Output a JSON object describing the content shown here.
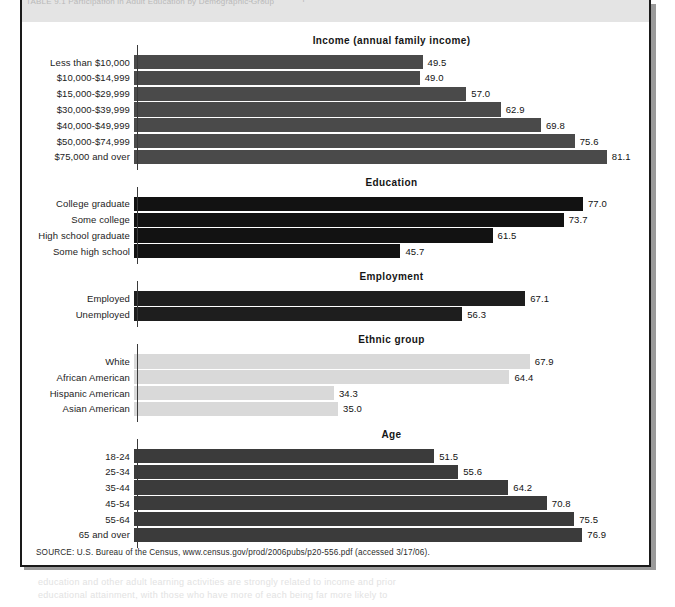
{
  "figure": {
    "header_ghost_text": "TABLE 9.1  Participation in Adult Education by Demographic Group",
    "source": "SOURCE: U.S. Bureau of the Census, www.census.gov/prod/2006pubs/p20-556.pdf (accessed 3/17/06).",
    "bleed_below_line1": "education and other adult learning activities are strongly related to income and prior",
    "bleed_below_line2": "educational attainment, with those who have more of each being far more likely to"
  },
  "chart_data": {
    "type": "bar",
    "orientation": "horizontal",
    "title": "",
    "xlabel": "",
    "ylabel": "",
    "xlim": [
      0,
      100
    ],
    "grid": false,
    "legend": false,
    "axis_max": 100,
    "sections": [
      {
        "name": "Income (annual family income)",
        "color": "#4a4a4a",
        "categories": [
          "Less than $10,000",
          "$10,000-$14,999",
          "$15,000-$29,999",
          "$30,000-$39,999",
          "$40,000-$49,999",
          "$50,000-$74,999",
          "$75,000 and over"
        ],
        "values": [
          49.5,
          49.0,
          57.0,
          62.9,
          69.8,
          75.6,
          81.1
        ],
        "labels": [
          "49.5",
          "49.0",
          "57.0",
          "62.9",
          "69.8",
          "75.6",
          "81.1"
        ]
      },
      {
        "name": "Education",
        "color": "#121212",
        "categories": [
          "College graduate",
          "Some college",
          "High school graduate",
          "Some high school"
        ],
        "values": [
          77.0,
          73.7,
          61.5,
          45.7
        ],
        "labels": [
          "77.0",
          "73.7",
          "61.5",
          "45.7"
        ]
      },
      {
        "name": "Employment",
        "color": "#1e1e1e",
        "categories": [
          "Employed",
          "Unemployed"
        ],
        "values": [
          67.1,
          56.3
        ],
        "labels": [
          "67.1",
          "56.3"
        ]
      },
      {
        "name": "Ethnic group",
        "color": "#d9d9d9",
        "categories": [
          "White",
          "African American",
          "Hispanic American",
          "Asian American"
        ],
        "values": [
          67.9,
          64.4,
          34.3,
          35.0
        ],
        "labels": [
          "67.9",
          "64.4",
          "34.3",
          "35.0"
        ]
      },
      {
        "name": "Age",
        "color": "#3b3b3b",
        "categories": [
          "18-24",
          "25-34",
          "35-44",
          "45-54",
          "55-64",
          "65 and over"
        ],
        "values": [
          51.5,
          55.6,
          64.2,
          70.8,
          75.5,
          76.9
        ],
        "labels": [
          "51.5",
          "55.6",
          "64.2",
          "70.8",
          "75.5",
          "76.9"
        ]
      }
    ]
  }
}
